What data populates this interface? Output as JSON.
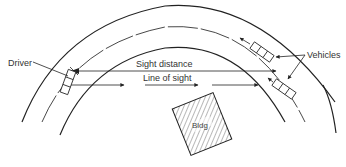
{
  "diagram": {
    "labels": {
      "driver": "Driver",
      "sight_distance": "Sight distance",
      "line_of_sight": "Line of sight",
      "vehicles": "Vehicles",
      "building": "Bldg"
    },
    "elements": [
      {
        "id": "outer-road-edge",
        "type": "arc"
      },
      {
        "id": "center-line",
        "type": "dashed-arc"
      },
      {
        "id": "inner-road-edge",
        "type": "arc"
      },
      {
        "id": "driver-vehicle",
        "type": "vehicle"
      },
      {
        "id": "oncoming-vehicle",
        "type": "vehicle"
      },
      {
        "id": "opposing-vehicle",
        "type": "vehicle"
      },
      {
        "id": "building-obstruction",
        "type": "hatched-rectangle"
      },
      {
        "id": "sight-distance-line",
        "type": "dimension-arrow"
      },
      {
        "id": "line-of-sight-line",
        "type": "arrow-line"
      }
    ],
    "colors": {
      "line": "#222222",
      "background": "#ffffff"
    }
  }
}
